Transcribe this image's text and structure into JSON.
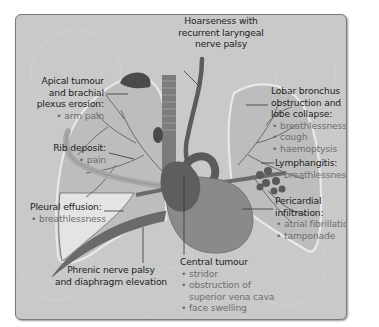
{
  "diagram": {
    "colors": {
      "panel_bg": "#c9c9c9",
      "panel_border": "#7a7a7a",
      "lung_fill": "#bdbdbd",
      "lung_outline": "#e6e6e6",
      "vessels": "#6a6a6a",
      "heart": "#8a8a8a",
      "tumour": "#4a4a4a",
      "effusion": "#e4e4e4",
      "heading_text": "#262626",
      "bullet_text": "#6e6e6e"
    },
    "labels": {
      "hoarseness": {
        "heading": "Hoarseness with recurrent laryngeal nerve palsy",
        "lines": [
          "Hoarseness with",
          "recurrent laryngeal",
          "nerve palsy"
        ],
        "bullets": []
      },
      "apical": {
        "lines": [
          "Apical tumour",
          "and brachial",
          "plexus erosion:"
        ],
        "bullets": [
          "arm pain"
        ]
      },
      "rib": {
        "lines": [
          "Rib deposit:"
        ],
        "bullets": [
          "pain"
        ]
      },
      "pleural": {
        "lines": [
          "Pleural effusion:"
        ],
        "bullets": [
          "breathlessness"
        ]
      },
      "phrenic": {
        "lines": [
          "Phrenic nerve palsy",
          "and diaphragm elevation"
        ],
        "bullets": []
      },
      "lobar": {
        "lines": [
          "Lobar bronchus",
          "obstruction and",
          "lobe collapse:"
        ],
        "bullets": [
          "breathlessness",
          "cough",
          "haemoptysis"
        ]
      },
      "lymph": {
        "lines": [
          "Lymphangitis:"
        ],
        "bullets": [
          "breathlessness"
        ]
      },
      "pericardial": {
        "lines": [
          "Pericardial",
          "infiltration:"
        ],
        "bullets": [
          "atrial fibrillation",
          "tamponade"
        ]
      },
      "central": {
        "lines": [
          "Central tumour"
        ],
        "bullets": [
          "stridor",
          "obstruction of superior vena cava",
          "face swelling"
        ],
        "bullet_lines": [
          [
            "stridor"
          ],
          [
            "obstruction of",
            "superior vena cava"
          ],
          [
            "face swelling"
          ]
        ]
      }
    }
  }
}
